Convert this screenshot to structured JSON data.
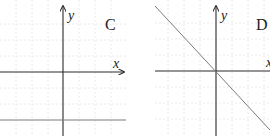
{
  "panels": [
    {
      "id": "C",
      "label": "C",
      "x_axis_label": "x",
      "y_axis_label": "y",
      "description": "Horizontal line below the x-axis (y = negative constant)",
      "line": {
        "type": "horizontal",
        "y_value": -3
      }
    },
    {
      "id": "D",
      "label": "D",
      "x_axis_label": "x",
      "y_axis_label": "y",
      "description": "Line through the origin with negative slope (y = -x)",
      "line": {
        "type": "linear",
        "slope": -1,
        "intercept": 0
      }
    }
  ],
  "colors": {
    "axis": "#2a2a2a",
    "line": "#7a7a7a",
    "grid": "#e4e4e4"
  }
}
